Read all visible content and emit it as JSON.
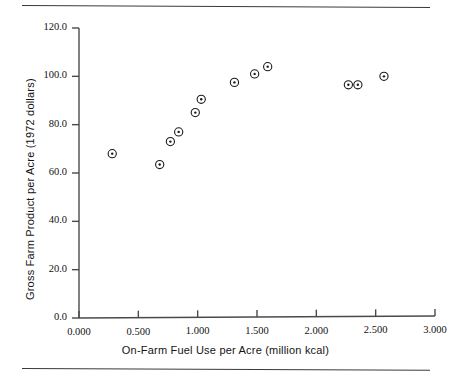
{
  "figure": {
    "rule_top_label": "top-horizontal-rule",
    "rule_bottom_label": "bottom-horizontal-rule"
  },
  "chart_data": {
    "type": "scatter",
    "title": "",
    "xlabel": "On-Farm Fuel Use per Acre (million kcal)",
    "ylabel": "Gross Farm Product per Acre (1972 dollars)",
    "xlim": [
      0.0,
      3.0
    ],
    "ylim": [
      0.0,
      120.0
    ],
    "xticks": [
      0.0,
      0.5,
      1.0,
      1.5,
      2.0,
      2.5,
      3.0
    ],
    "xtick_labels": [
      "0.000",
      "0.500",
      "1.000",
      "1.500",
      "2.000",
      "2.500",
      "3.000"
    ],
    "yticks": [
      0.0,
      20.0,
      40.0,
      60.0,
      80.0,
      100.0,
      120.0
    ],
    "ytick_labels": [
      "0.0",
      "20.0",
      "40.0",
      "60.0",
      "80.0",
      "100.0",
      "120.0"
    ],
    "grid": false,
    "legend": null,
    "marker": "circle-with-center-dot",
    "marker_color": "#1a1a1a",
    "axis_color": "#4a4a4a",
    "points": [
      {
        "x": 0.28,
        "y": 68.0
      },
      {
        "x": 0.68,
        "y": 63.5
      },
      {
        "x": 0.77,
        "y": 73.0
      },
      {
        "x": 0.84,
        "y": 77.0
      },
      {
        "x": 0.98,
        "y": 85.0
      },
      {
        "x": 1.03,
        "y": 90.5
      },
      {
        "x": 1.31,
        "y": 97.5
      },
      {
        "x": 1.48,
        "y": 101.0
      },
      {
        "x": 1.59,
        "y": 104.0
      },
      {
        "x": 2.27,
        "y": 96.5
      },
      {
        "x": 2.35,
        "y": 96.5
      },
      {
        "x": 2.57,
        "y": 100.0
      }
    ]
  }
}
